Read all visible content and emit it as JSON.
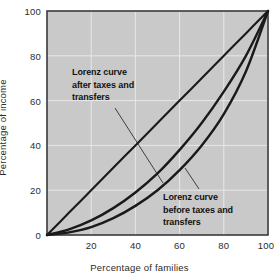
{
  "chart_data": {
    "type": "line",
    "title": "",
    "xlabel": "Percentage of families",
    "ylabel": "Percentage of income",
    "xlim": [
      0,
      100
    ],
    "ylim": [
      0,
      100
    ],
    "xticks": [
      20,
      40,
      60,
      80,
      100
    ],
    "yticks": [
      0,
      20,
      40,
      60,
      80,
      100
    ],
    "grid": true,
    "legend_position": "inline-annotations",
    "plot_background": "#c9c9c9",
    "line_color": "#1a1a1a",
    "grid_color": "#e8e8e8",
    "series": [
      {
        "name": "Line of equality",
        "annotation": "",
        "x": [
          0,
          10,
          20,
          30,
          40,
          50,
          60,
          70,
          80,
          90,
          100
        ],
        "values": [
          0,
          10,
          20,
          30,
          40,
          50,
          60,
          70,
          80,
          90,
          100
        ]
      },
      {
        "name": "Lorenz curve after taxes and transfers",
        "annotation": "Lorenz curve after taxes and transfers",
        "x": [
          0,
          10,
          20,
          30,
          40,
          50,
          60,
          70,
          80,
          90,
          100
        ],
        "values": [
          0,
          2.5,
          6.5,
          12,
          19,
          27.5,
          38,
          50,
          64,
          80,
          100
        ]
      },
      {
        "name": "Lorenz curve before taxes and transfers",
        "annotation": "Lorenz curve before taxes and transfers",
        "x": [
          0,
          10,
          20,
          30,
          40,
          50,
          60,
          70,
          80,
          90,
          100
        ],
        "values": [
          0,
          1.2,
          3.5,
          7.5,
          13,
          20,
          29,
          40,
          54,
          73,
          100
        ]
      }
    ],
    "annotations": [
      {
        "id": "after",
        "lines": [
          "Lorenz curve",
          "after taxes and",
          "transfers"
        ],
        "leader_from": [
          115,
          108
        ],
        "leader_to": [
          163,
          183
        ]
      },
      {
        "id": "before",
        "lines": [
          "Lorenz curve",
          "before taxes and",
          "transfers"
        ],
        "leader_from": [
          199,
          189
        ],
        "leader_to": [
          185,
          168
        ]
      }
    ]
  },
  "axes": {
    "x_title": "Percentage of families",
    "y_title": "Percentage of income",
    "x_ticks": [
      "20",
      "40",
      "60",
      "80",
      "100"
    ],
    "y_ticks": [
      "0",
      "20",
      "40",
      "60",
      "80",
      "100"
    ]
  },
  "annotation_after": {
    "line1": "Lorenz curve",
    "line2": "after taxes and",
    "line3": "transfers"
  },
  "annotation_before": {
    "line1": "Lorenz curve",
    "line2": "before taxes and",
    "line3": "transfers"
  }
}
